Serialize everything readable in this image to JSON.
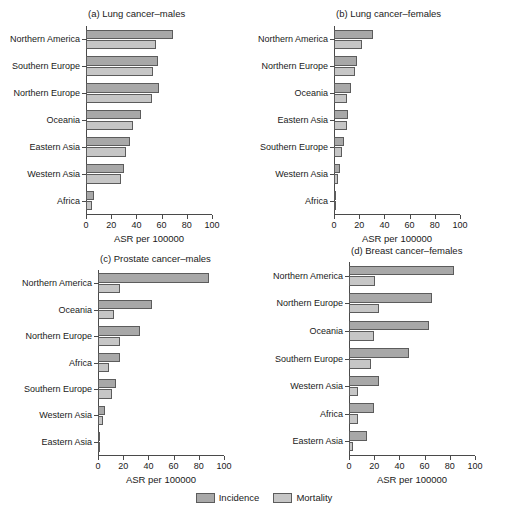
{
  "figure": {
    "width": 528,
    "height": 519,
    "axis_title": "ASR per 100000",
    "xticks": [
      0,
      20,
      40,
      60,
      80,
      100
    ],
    "xlim": [
      0,
      100
    ],
    "colors": {
      "incidence": "#a8a8a8",
      "mortality": "#c6c6c6",
      "bar_border": "#5c5c5c",
      "axis": "#4a4a4a",
      "text": "#1a1a1a",
      "background": "#ffffff"
    }
  },
  "legend": {
    "items": [
      {
        "label": "Incidence",
        "key": "incidence"
      },
      {
        "label": "Mortality",
        "key": "mortality"
      }
    ]
  },
  "chart_data": [
    {
      "id": "a",
      "type": "bar",
      "title": "(a) Lung cancer–males",
      "orientation": "horizontal",
      "xlabel": "ASR per 100000",
      "ylabel": "",
      "xlim": [
        0,
        100
      ],
      "xticks": [
        0,
        20,
        40,
        60,
        80,
        100
      ],
      "grid": false,
      "legend_position": "bottom-figure",
      "categories": [
        "Northern America",
        "Southern Europe",
        "Northern Europe",
        "Oceania",
        "Eastern Asia",
        "Western Asia",
        "Africa"
      ],
      "series": [
        {
          "name": "Incidence",
          "values": [
            69.0,
            57.5,
            58.0,
            44.0,
            35.0,
            30.5,
            6.0
          ]
        },
        {
          "name": "Mortality",
          "values": [
            55.5,
            53.5,
            52.0,
            37.5,
            31.5,
            28.0,
            4.5
          ]
        }
      ]
    },
    {
      "id": "b",
      "type": "bar",
      "title": "(b) Lung cancer–females",
      "orientation": "horizontal",
      "xlabel": "ASR per 100000",
      "ylabel": "",
      "xlim": [
        0,
        100
      ],
      "xticks": [
        0,
        20,
        40,
        60,
        80,
        100
      ],
      "grid": false,
      "legend_position": "bottom-figure",
      "categories": [
        "Northern America",
        "Northern Europe",
        "Oceania",
        "Eastern Asia",
        "Southern Europe",
        "Western Asia",
        "Africa"
      ],
      "series": [
        {
          "name": "Incidence",
          "values": [
            31.0,
            18.5,
            13.5,
            11.0,
            8.0,
            4.5,
            1.5
          ]
        },
        {
          "name": "Mortality",
          "values": [
            22.5,
            16.5,
            10.5,
            10.0,
            6.5,
            3.5,
            1.3
          ]
        }
      ]
    },
    {
      "id": "c",
      "type": "bar",
      "title": "(c) Prostate cancer–males",
      "orientation": "horizontal",
      "xlabel": "ASR per 100000",
      "ylabel": "",
      "xlim": [
        0,
        100
      ],
      "xticks": [
        0,
        20,
        40,
        60,
        80,
        100
      ],
      "grid": false,
      "legend_position": "bottom-figure",
      "categories": [
        "Northern America",
        "Oceania",
        "Northern Europe",
        "Africa",
        "Southern Europe",
        "Western Asia",
        "Eastern Asia"
      ],
      "series": [
        {
          "name": "Incidence",
          "values": [
            88.0,
            43.0,
            33.0,
            17.5,
            14.5,
            5.5,
            1.5
          ]
        },
        {
          "name": "Mortality",
          "values": [
            17.5,
            13.0,
            17.5,
            9.0,
            11.0,
            4.0,
            0.7
          ]
        }
      ]
    },
    {
      "id": "d",
      "type": "bar",
      "title": "(d) Breast cancer–females",
      "orientation": "horizontal",
      "xlabel": "ASR per 100000",
      "ylabel": "",
      "xlim": [
        0,
        100
      ],
      "xticks": [
        0,
        20,
        40,
        60,
        80,
        100
      ],
      "grid": false,
      "legend_position": "bottom-figure",
      "categories": [
        "Northern America",
        "Northern Europe",
        "Oceania",
        "Southern Europe",
        "Western Asia",
        "Africa",
        "Eastern Asia"
      ],
      "series": [
        {
          "name": "Incidence",
          "values": [
            83.0,
            66.0,
            63.5,
            48.0,
            23.5,
            19.5,
            14.5
          ]
        },
        {
          "name": "Mortality",
          "values": [
            21.0,
            23.5,
            20.0,
            17.5,
            7.5,
            7.0,
            3.0
          ]
        }
      ]
    }
  ]
}
